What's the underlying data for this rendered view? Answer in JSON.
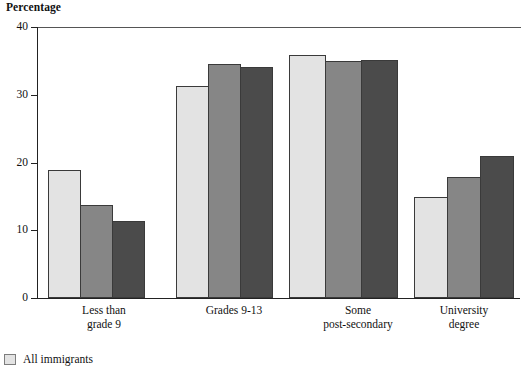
{
  "chart_data": {
    "type": "bar",
    "title": "",
    "ylabel": "Percentage",
    "xlabel": "",
    "ylim": [
      0,
      40
    ],
    "yticks": [
      0,
      10,
      20,
      30,
      40
    ],
    "grid": false,
    "legend_position": "bottom-left",
    "categories": [
      "Less than\ngrade 9",
      "Grades 9-13",
      "Some\npost-secondary",
      "University\ndegree"
    ],
    "category_lines": [
      [
        "Less than",
        "grade 9"
      ],
      [
        "Grades 9-13",
        ""
      ],
      [
        "Some",
        "post-secondary"
      ],
      [
        "University",
        "degree"
      ]
    ],
    "series": [
      {
        "name": "All immigrants",
        "color": "#e3e3e3",
        "values": [
          18.9,
          31.3,
          35.8,
          14.9
        ]
      },
      {
        "name": "",
        "color": "#868686",
        "values": [
          13.8,
          34.5,
          35.0,
          17.9
        ]
      },
      {
        "name": "",
        "color": "#4b4b4b",
        "values": [
          11.3,
          34.1,
          35.2,
          21.0
        ]
      }
    ]
  },
  "legend": {
    "items": [
      {
        "label": "All immigrants",
        "color": "#e3e3e3"
      }
    ]
  },
  "axis": {
    "y_tick_labels": [
      "40",
      "30",
      "20",
      "10",
      "0"
    ]
  }
}
